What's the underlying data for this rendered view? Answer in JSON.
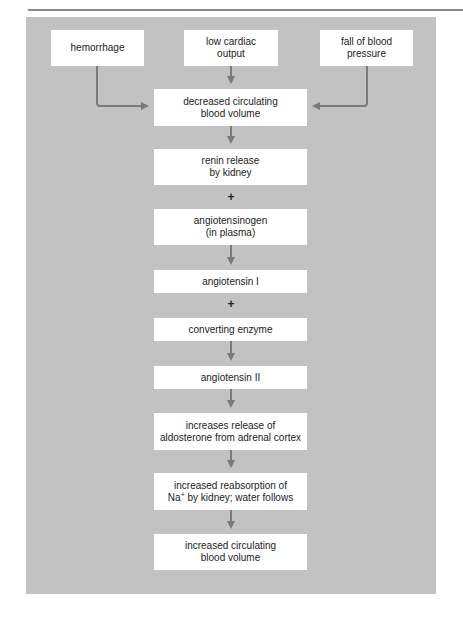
{
  "diagram": {
    "type": "flowchart",
    "title": "",
    "colors": {
      "panel": "#c2c2c2",
      "box": "#ffffff",
      "arrow": "#7a7a7a",
      "text": "#222222"
    },
    "inputs": [
      {
        "id": "hemorrhage",
        "lines": [
          "hemorrhage"
        ]
      },
      {
        "id": "low-cardiac-output",
        "lines": [
          "low cardiac",
          "output"
        ]
      },
      {
        "id": "fall-of-blood-pressure",
        "lines": [
          "fall of blood",
          "pressure"
        ]
      }
    ],
    "steps": [
      {
        "id": "decreased-volume",
        "lines": [
          "decreased circulating",
          "blood volume"
        ]
      },
      {
        "id": "renin",
        "lines": [
          "renin release",
          "by kidney"
        ]
      },
      {
        "id": "angiotensinogen",
        "lines": [
          "angiotensinogen",
          "(in plasma)"
        ]
      },
      {
        "id": "angiotensin-1",
        "lines": [
          "angiotensin I"
        ]
      },
      {
        "id": "converting-enzyme",
        "lines": [
          "converting enzyme"
        ]
      },
      {
        "id": "angiotensin-2",
        "lines": [
          "angiotensin II"
        ]
      },
      {
        "id": "aldosterone",
        "lines": [
          "increases release of",
          "aldosterone from adrenal cortex"
        ]
      },
      {
        "id": "reabsorption",
        "lines": [
          "increased reabsorption of",
          "by kidney; water follows"
        ],
        "prefix": "Na",
        "superscript": "+"
      },
      {
        "id": "increased-volume",
        "lines": [
          "increased circulating",
          "blood volume"
        ]
      }
    ],
    "connectors": [
      {
        "from": "hemorrhage",
        "to": "decreased-volume",
        "kind": "arrow"
      },
      {
        "from": "low-cardiac-output",
        "to": "decreased-volume",
        "kind": "arrow"
      },
      {
        "from": "fall-of-blood-pressure",
        "to": "decreased-volume",
        "kind": "arrow"
      },
      {
        "from": "decreased-volume",
        "to": "renin",
        "kind": "arrow"
      },
      {
        "from": "renin",
        "to": "angiotensinogen",
        "kind": "plus",
        "label": "+"
      },
      {
        "from": "angiotensinogen",
        "to": "angiotensin-1",
        "kind": "arrow"
      },
      {
        "from": "angiotensin-1",
        "to": "converting-enzyme",
        "kind": "plus",
        "label": "+"
      },
      {
        "from": "converting-enzyme",
        "to": "angiotensin-2",
        "kind": "arrow"
      },
      {
        "from": "angiotensin-2",
        "to": "aldosterone",
        "kind": "arrow"
      },
      {
        "from": "aldosterone",
        "to": "reabsorption",
        "kind": "arrow"
      },
      {
        "from": "reabsorption",
        "to": "increased-volume",
        "kind": "arrow"
      }
    ]
  }
}
